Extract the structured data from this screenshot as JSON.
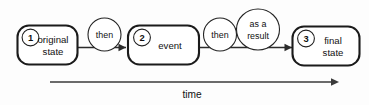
{
  "diagram": {
    "type": "state-transition-flow",
    "background_color": "#fdfdfd",
    "stroke_color": "#1b1b1b",
    "nodes": [
      {
        "id": "1",
        "number": "1",
        "line1": "original",
        "line2": "state"
      },
      {
        "id": "2",
        "number": "2",
        "line1": "event",
        "line2": ""
      },
      {
        "id": "3",
        "number": "3",
        "line1": "final",
        "line2": "state"
      }
    ],
    "edge_labels": [
      {
        "id": "then-1",
        "line1": "then",
        "line2": ""
      },
      {
        "id": "then-2",
        "line1": "then",
        "line2": ""
      },
      {
        "id": "as-a-result",
        "line1": "as a",
        "line2": "result"
      }
    ],
    "axis": {
      "label": "time",
      "direction": "left-to-right"
    }
  }
}
